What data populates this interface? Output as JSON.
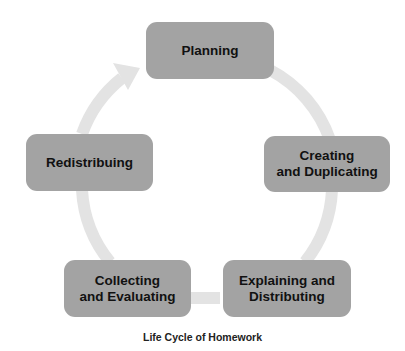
{
  "diagram": {
    "title": "Life Cycle of Homework",
    "stages": [
      {
        "label": "Planning"
      },
      {
        "label": "Creating\nand Duplicating"
      },
      {
        "label": "Explaining and\nDistributing"
      },
      {
        "label": "Collecting\nand Evaluating"
      },
      {
        "label": "Redistribuing"
      }
    ],
    "colors": {
      "box": "#a3a3a3",
      "arrow": "#e3e3e3",
      "text": "#111111"
    }
  }
}
